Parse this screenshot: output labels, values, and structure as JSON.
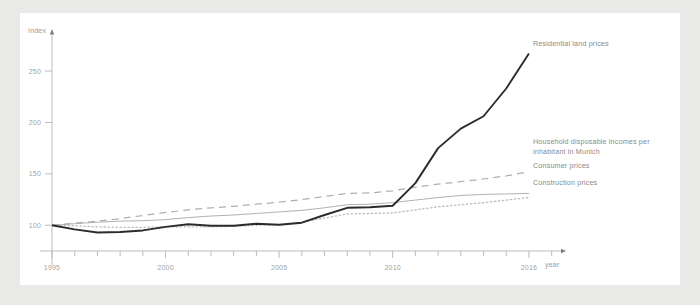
{
  "chart_data": {
    "type": "line",
    "title": "",
    "xlabel": "year",
    "ylabel": "Index",
    "xlim": [
      1995,
      2017.5
    ],
    "ylim": [
      75,
      285
    ],
    "grid": false,
    "legend_position": "right",
    "y_ticks": [
      "100",
      "150",
      "200",
      "250"
    ],
    "y_tick_values": [
      100,
      150,
      200,
      250
    ],
    "x_ticks": [
      "1995",
      "2000",
      "2005",
      "2010",
      "2016"
    ],
    "x_tick_values": [
      1995,
      2000,
      2005,
      2010,
      2016
    ],
    "x_minor_from": 1995,
    "x_minor_to": 2017,
    "x": [
      1995,
      1996,
      1997,
      1998,
      1999,
      2000,
      2001,
      2002,
      2003,
      2004,
      2005,
      2006,
      2007,
      2008,
      2009,
      2010,
      2011,
      2012,
      2013,
      2014,
      2015,
      2016
    ],
    "series": [
      {
        "name": "Residential land prices",
        "style": "solid-thick",
        "color": "#2b2b2b",
        "values": [
          100,
          96,
          93,
          93.5,
          95,
          98.5,
          101,
          99.5,
          99.5,
          101.5,
          100.5,
          102.5,
          110,
          117,
          117.5,
          119,
          141,
          175,
          194,
          206,
          233,
          267
        ]
      },
      {
        "name": "Household disposable incomes per inhabitant in Munich",
        "style": "dashed",
        "color": "#b0b0b0",
        "values": [
          100,
          102,
          104,
          106.5,
          109.5,
          112.5,
          115,
          117,
          118.5,
          120.5,
          122.5,
          125,
          128,
          131,
          131.5,
          133.5,
          137,
          140,
          142.5,
          145,
          148,
          152
        ]
      },
      {
        "name": "Consumer prices",
        "style": "solid-thin",
        "color": "#a8a8a8",
        "values": [
          100,
          101.5,
          103,
          104,
          104.5,
          105.5,
          107.5,
          109,
          110,
          111.5,
          113,
          114.5,
          117,
          120,
          120.5,
          122,
          124.5,
          127,
          129,
          130,
          130.5,
          131
        ]
      },
      {
        "name": "Construction prices",
        "style": "dotted",
        "color": "#bdbdbd",
        "values": [
          100,
          99.5,
          98.5,
          98,
          98,
          98.5,
          98.5,
          98.5,
          99,
          100,
          100.5,
          103,
          107,
          111,
          111.5,
          112,
          115,
          118,
          120,
          122,
          124.5,
          127
        ]
      }
    ]
  },
  "axes": {
    "y_axis_title": "Index",
    "x_axis_title": "year"
  },
  "legend": {
    "residential": "Residential land prices",
    "household_line1": "Household disposable incomes per",
    "household_line2": "inhabitant in Munich",
    "consumer": "Consumer prices",
    "construction": "Construction prices"
  },
  "colors": {
    "page_background": "#e9e9e7",
    "card_background": "#ffffff",
    "axis": "#b4b4b4",
    "tick_text": "#a3a3a3",
    "legend_text": "#8a8a8a",
    "series_residential": "#2b2b2b",
    "series_household": "#b0b0b0",
    "series_consumer": "#a8a8a8",
    "series_construction": "#bdbdbd"
  }
}
